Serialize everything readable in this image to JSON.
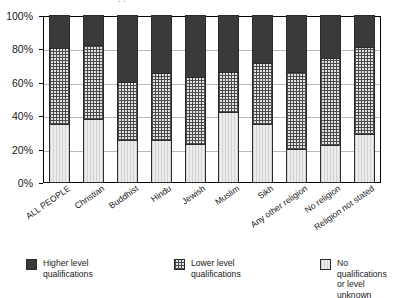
{
  "chart_data": {
    "type": "bar",
    "stacked": true,
    "title": "",
    "xlabel": "",
    "ylabel": "",
    "ylim": [
      0,
      100
    ],
    "ytick_labels": [
      "0%",
      "20%",
      "40%",
      "60%",
      "80%",
      "100%"
    ],
    "ytick_values": [
      0,
      20,
      40,
      60,
      80,
      100
    ],
    "grid": true,
    "legend_position": "bottom",
    "categories": [
      "ALL PEOPLE",
      "Christian",
      "Buddhist",
      "Hindu",
      "Jewish",
      "Muslim",
      "Sikh",
      "Any other religion",
      "No religion",
      "Religion not stated"
    ],
    "series": [
      {
        "name": "No qualifications or level unknown",
        "key": "none",
        "values": [
          35,
          38,
          25,
          25,
          23,
          42,
          35,
          20,
          22,
          29
        ]
      },
      {
        "name": "Lower level qualifications",
        "key": "lower",
        "values": [
          45,
          44,
          35,
          40,
          40,
          24,
          36,
          46,
          52,
          52
        ]
      },
      {
        "name": "Higher level qualifications",
        "key": "higher",
        "values": [
          20,
          18,
          40,
          35,
          37,
          34,
          29,
          34,
          26,
          19
        ]
      }
    ],
    "cumulative_tops": {
      "none": [
        35,
        38,
        25,
        25,
        23,
        42,
        35,
        20,
        22,
        29
      ],
      "lower": [
        80,
        82,
        60,
        65,
        63,
        66,
        71,
        66,
        74,
        81
      ],
      "higher": [
        100,
        100,
        100,
        100,
        100,
        100,
        100,
        100,
        100,
        100
      ]
    }
  },
  "legend": {
    "items": [
      {
        "label": "Higher level qualifications",
        "swatch": "higher"
      },
      {
        "label": "Lower level qualifications",
        "swatch": "lower"
      },
      {
        "label": "No qualifications or level unknown",
        "swatch": "none"
      }
    ]
  },
  "colors": {
    "higher": "#3a3a3a",
    "lower": "#e3e3e3",
    "none": "#ececec",
    "axis": "#000000",
    "grid": "#b9b9b9"
  },
  "top_crop_glyph": "˙˙"
}
